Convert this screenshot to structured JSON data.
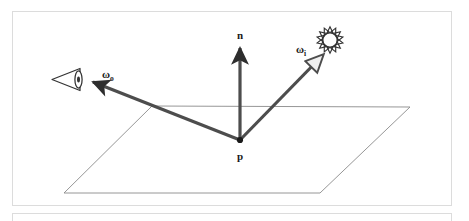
{
  "figure": {
    "background_color": "#ffffff",
    "frame_color": "#dcdcdc"
  },
  "labels": {
    "normal": "n",
    "outgoing_symbol": "ω",
    "outgoing_subscript": "o",
    "incoming_symbol": "ω",
    "incoming_subscript": "i",
    "point": "p"
  },
  "icons": {
    "eye": "eye-icon",
    "sun": "sun-icon",
    "surface_point": "point-dot-icon"
  },
  "colors": {
    "vector_stroke": "#4d4d4d",
    "arrow_fill_solid": "#333333",
    "arrow_fill_open": "#f2f2f2",
    "plane_stroke": "#808080",
    "label_text": "#1a1a1a",
    "icon_stroke": "#333333"
  },
  "geometry": {
    "point_p": {
      "x": 240,
      "y": 140
    },
    "normal_tip": {
      "x": 240,
      "y": 48
    },
    "omega_o_tip": {
      "x": 93,
      "y": 82
    },
    "omega_i_tip": {
      "x": 322,
      "y": 56
    },
    "plane_corners": [
      {
        "x": 152,
        "y": 106
      },
      {
        "x": 410,
        "y": 107
      },
      {
        "x": 320,
        "y": 193
      },
      {
        "x": 64,
        "y": 193
      }
    ],
    "eye_center": {
      "x": 68,
      "y": 79
    },
    "sun_center": {
      "x": 330,
      "y": 40
    },
    "sun_ray_count": 14
  }
}
